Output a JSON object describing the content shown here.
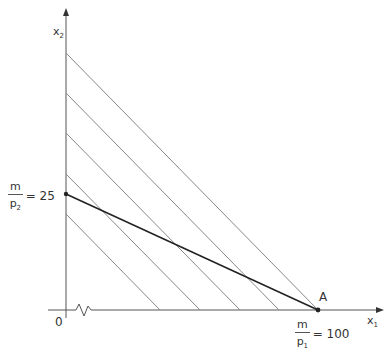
{
  "diagram": {
    "axes": {
      "y_label": "x",
      "y_label_sub": "2",
      "x_label": "x",
      "x_label_sub": "1",
      "origin_label": "0"
    },
    "y_intercept": {
      "num": "m",
      "den": "p",
      "den_sub": "2",
      "value": "= 25"
    },
    "x_intercept": {
      "num": "m",
      "den": "p",
      "den_sub": "1",
      "value": "= 100"
    },
    "point_label": "A",
    "colors": {
      "axis": "#555555",
      "indifference_lines": "#888888",
      "budget_line": "#222222"
    },
    "indifference_lines_count": 5
  }
}
